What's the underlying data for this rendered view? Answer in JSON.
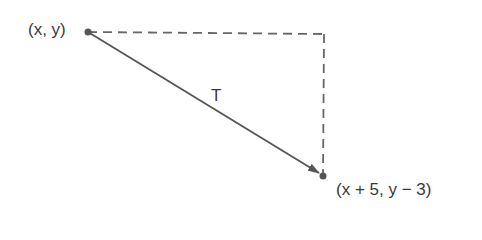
{
  "diagram": {
    "start_label": "(x, y)",
    "end_label": "(x + 5, y − 3)",
    "vector_label": "T",
    "colors": {
      "line": "#555555",
      "text": "#3a3a3a",
      "background": "#ffffff"
    }
  }
}
